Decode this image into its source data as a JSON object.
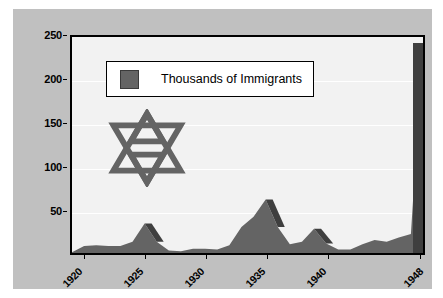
{
  "chart_data": {
    "type": "area",
    "title": "",
    "subtitle": "",
    "xlabel": "",
    "ylabel": "",
    "legend": [
      {
        "label": "Thousands of Immigrants",
        "color": "#646464"
      }
    ],
    "legend_position": "top-left",
    "grid": true,
    "ylim": [
      0,
      250
    ],
    "xlim": [
      1919,
      1948
    ],
    "yticks": [
      50,
      100,
      150,
      200,
      250
    ],
    "ytick_labels": [
      "50",
      "100",
      "150",
      "200",
      "250"
    ],
    "xticks": [
      1920,
      1925,
      1930,
      1935,
      1940,
      1948
    ],
    "xtick_labels": [
      "1920",
      "1925",
      "1930",
      "1935",
      "1940",
      "1948"
    ],
    "series": [
      {
        "name": "Thousands of Immigrants",
        "color": "#646464",
        "x": [
          1919,
          1920,
          1921,
          1922,
          1923,
          1924,
          1925,
          1926,
          1927,
          1928,
          1929,
          1930,
          1931,
          1932,
          1933,
          1934,
          1935,
          1936,
          1937,
          1938,
          1939,
          1940,
          1941,
          1942,
          1943,
          1944,
          1945,
          1946,
          1947,
          1948
        ],
        "values": [
          1,
          8,
          9,
          8,
          8,
          13,
          34,
          13,
          3,
          2,
          5,
          5,
          4,
          9,
          30,
          42,
          62,
          30,
          10,
          13,
          28,
          11,
          4,
          4,
          10,
          15,
          13,
          18,
          22,
          243
        ]
      }
    ],
    "annotations": [
      {
        "name": "star-of-david",
        "type": "symbol",
        "color": "#646464"
      }
    ],
    "colors": {
      "canvas": "#c0c0c0",
      "plot_background": "#f2f2f2",
      "series_fill": "#646464",
      "series_shade": "#3f3f3f",
      "frame": "#000000",
      "gridline": "#ffffff"
    }
  },
  "legend": {
    "entry_label": "Thousands of Immigrants"
  }
}
